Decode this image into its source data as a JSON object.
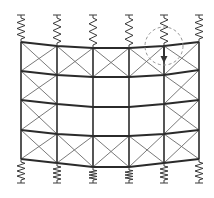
{
  "diagram": {
    "title": "",
    "columns_x": [
      21,
      57,
      93,
      129,
      164,
      199
    ],
    "levels_y": [
      [
        42,
        46,
        48,
        48,
        46,
        42
      ],
      [
        71,
        75,
        77,
        77,
        75,
        70
      ],
      [
        100,
        104,
        107,
        107,
        104,
        100
      ],
      [
        130,
        134,
        136,
        136,
        134,
        130
      ],
      [
        159,
        163,
        167,
        167,
        163,
        159
      ]
    ],
    "braced_panels": [
      [
        true,
        true,
        true,
        true,
        true
      ],
      [
        true,
        false,
        false,
        false,
        true
      ],
      [
        true,
        false,
        false,
        false,
        true
      ],
      [
        true,
        true,
        true,
        true,
        true
      ]
    ],
    "top_springs": {
      "anchor_y": 15,
      "count": 6
    },
    "bottom_springs": {
      "anchor_y": 183,
      "count": 6
    },
    "load": {
      "column_index": 4,
      "x": 164,
      "y_start": 45,
      "y_end": 63,
      "icon": "down-arrow-icon"
    },
    "highlight": {
      "cx": 164,
      "cy": 46,
      "r": 19,
      "style": "dashed"
    },
    "colors": {
      "frame": "#2b2b2b",
      "brace": "#6a6a6a",
      "spring": "#3a3a3a",
      "highlight": "#8a8a8a",
      "background": "#ffffff"
    }
  }
}
